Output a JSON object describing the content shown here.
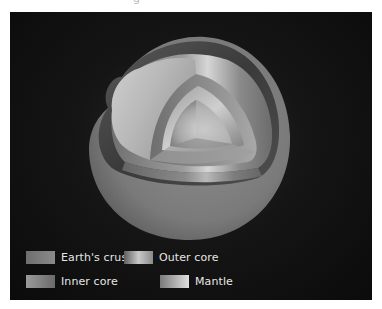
{
  "figure": {
    "title_fragment": "g",
    "background_color": "#111111"
  },
  "layers": [
    {
      "id": "crust",
      "label": "Earth's crust"
    },
    {
      "id": "mantle",
      "label": "Mantle"
    },
    {
      "id": "outer_core",
      "label": "Outer core"
    },
    {
      "id": "inner_core",
      "label": "Inner core"
    }
  ],
  "legend": {
    "items": [
      {
        "label": "Earth's crust",
        "swatch_from": "#6e6e6e",
        "swatch_to": "#8a8a8a"
      },
      {
        "label": "Outer core",
        "swatch_from": "#5e5e5e",
        "swatch_to": "#c8c8c8"
      },
      {
        "label": "Inner core",
        "swatch_from": "#9a9a9a",
        "swatch_to": "#6a6a6a"
      },
      {
        "label": "Mantle",
        "swatch_from": "#7a7a7a",
        "swatch_to": "#e0e0e0"
      }
    ]
  }
}
